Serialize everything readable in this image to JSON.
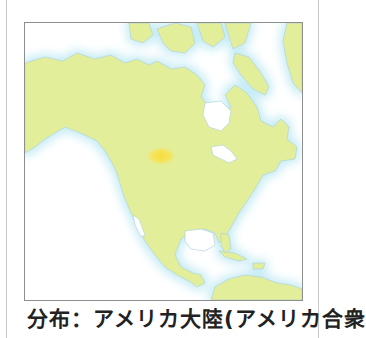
{
  "figure": {
    "type": "distribution-map",
    "region": "North America",
    "colors": {
      "land": "#e3ee9b",
      "coast_glow": "#cdeef6",
      "coastline": "#a9cfd8",
      "ocean": "#ffffff",
      "distribution_highlight": "#f7e04a",
      "map_border": "#8e8e8e",
      "frame_border": "#c9c9c9"
    },
    "highlight_area": {
      "label": "distribution",
      "approx_location": "northern Great Plains (USA)"
    }
  },
  "caption": {
    "text": "分布：アメリカ大陸(アメリカ合衆"
  }
}
